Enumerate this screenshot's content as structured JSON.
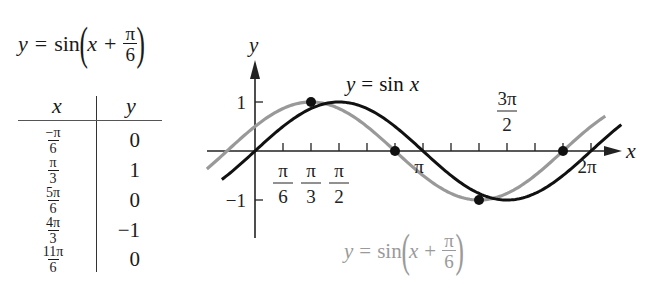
{
  "left_equation": {
    "lhs": "y",
    "eq": "=",
    "fn": "sin",
    "open": "(",
    "var": "x",
    "plus": "+",
    "num": "π",
    "den": "6",
    "close": ")"
  },
  "table": {
    "headers": {
      "x": "x",
      "y": "y"
    },
    "rows": [
      {
        "x_num": "−π",
        "x_den": "6",
        "y": "0"
      },
      {
        "x_num": "π",
        "x_den": "3",
        "y": "1"
      },
      {
        "x_num": "5π",
        "x_den": "6",
        "y": "0"
      },
      {
        "x_num": "4π",
        "x_den": "3",
        "y": "−1"
      },
      {
        "x_num": "11π",
        "x_den": "6",
        "y": "0"
      }
    ]
  },
  "chart_data": {
    "type": "line",
    "title": "",
    "xlabel": "x",
    "ylabel": "y",
    "xlim_radians": [
      -0.9,
      7.0
    ],
    "ylim": [
      -1.5,
      2
    ],
    "grid": false,
    "x_ticks_multiples_of_pi_over_6": [
      1,
      2,
      3,
      4,
      5,
      6,
      7,
      8,
      9,
      10,
      11,
      12
    ],
    "x_tick_labels": [
      {
        "at_pi_over_6": 1,
        "num": "π",
        "den": "6"
      },
      {
        "at_pi_over_6": 2,
        "num": "π",
        "den": "3"
      },
      {
        "at_pi_over_6": 3,
        "num": "π",
        "den": "2"
      },
      {
        "at_pi_over_6": 6,
        "text": "π"
      },
      {
        "at_pi_over_6": 9,
        "num": "3π",
        "den": "2"
      },
      {
        "at_pi_over_6": 12,
        "text": "2π"
      }
    ],
    "y_ticks": [
      1,
      -1
    ],
    "y_tick_labels": [
      "1",
      "−1"
    ],
    "series": [
      {
        "name": "y = sin x",
        "function": "sin(x)",
        "phase_shift": 0,
        "color": "#111111",
        "x_range_radians": [
          -0.62,
          6.85
        ]
      },
      {
        "name": "y = sin(x + π/6)",
        "function": "sin(x + π/6)",
        "phase_shift": 0.5236,
        "color": "#999999",
        "x_range_radians": [
          -0.9,
          6.55
        ]
      }
    ],
    "marked_points": [
      {
        "x_pi_over_6": 2,
        "y": 1,
        "approx_value": 0.866
      },
      {
        "x_pi_over_6": 5,
        "y": 0
      },
      {
        "x_pi_over_6": 8,
        "y": -1
      },
      {
        "x_pi_over_6": 11,
        "y": 0
      }
    ],
    "annotations": [
      {
        "text": "y = sin x",
        "color": "#111111"
      },
      {
        "text": "y = sin(x + π/6)",
        "color": "#999999"
      }
    ]
  },
  "graph_labels": {
    "sin_x": {
      "lhs": "y",
      "eq": "=",
      "fn": "sin",
      "var": "x"
    },
    "shifted": {
      "lhs": "y",
      "eq": "=",
      "fn": "sin",
      "open": "(",
      "var": "x",
      "plus": "+",
      "num": "π",
      "den": "6",
      "close": ")"
    }
  }
}
